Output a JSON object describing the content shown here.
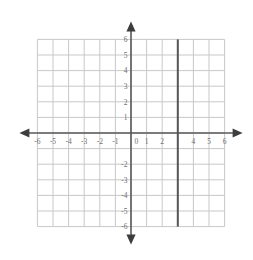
{
  "figure": {
    "kind": "cartesian-coordinate-plane",
    "background_color": "#ffffff",
    "grid_color": "#c8c8c8",
    "axis_color": "#58585a",
    "label_color": "#6e6e6e",
    "plot_line_color": "#55555a"
  },
  "chart_data": {
    "type": "line",
    "title": "",
    "subtitle": "",
    "xlabel": "",
    "ylabel": "",
    "xlim": [
      -6,
      6
    ],
    "ylim": [
      -6,
      6
    ],
    "grid": true,
    "legend": "none",
    "x_major_step": 1,
    "y_major_step": 1,
    "axis_arrows": [
      "left",
      "right",
      "up",
      "down"
    ],
    "x_tick_values": [
      -6,
      -5,
      -4,
      -3,
      -2,
      -1,
      0,
      1,
      2,
      4,
      5,
      6
    ],
    "x_tick_labels": [
      "-6",
      "-5",
      "-4",
      "-3",
      "-2",
      "-1",
      "0",
      "1",
      "2",
      "4",
      "5",
      "6"
    ],
    "x_tick_hidden_values": [
      3
    ],
    "y_tick_values": [
      6,
      5,
      4,
      3,
      2,
      1,
      -2,
      -3,
      -4,
      -5,
      -6
    ],
    "y_tick_labels": [
      "6",
      "5",
      "4",
      "3",
      "2",
      "1",
      "-2",
      "-3",
      "-4",
      "-5",
      "-6"
    ],
    "y_tick_hidden_values": [
      -1
    ],
    "origin_label": "0",
    "series": [
      {
        "name": "x = 3",
        "kind": "vertical-line",
        "equation": "x = 3",
        "x": 3,
        "y_from": -6,
        "y_to": 6,
        "color": "#55555a",
        "width_px": 2
      }
    ]
  },
  "labels": {
    "x_axis": [
      {
        "value": -6,
        "text": "-6"
      },
      {
        "value": -5,
        "text": "-5"
      },
      {
        "value": -4,
        "text": "-4"
      },
      {
        "value": -3,
        "text": "-3"
      },
      {
        "value": -2,
        "text": "-2"
      },
      {
        "value": -1,
        "text": "-1"
      },
      {
        "value": 0,
        "text": "0"
      },
      {
        "value": 1,
        "text": "1"
      },
      {
        "value": 2,
        "text": "2"
      },
      {
        "value": 4,
        "text": "4"
      },
      {
        "value": 5,
        "text": "5"
      },
      {
        "value": 6,
        "text": "6"
      }
    ],
    "y_axis": [
      {
        "value": 6,
        "text": "6"
      },
      {
        "value": 5,
        "text": "5"
      },
      {
        "value": 4,
        "text": "4"
      },
      {
        "value": 3,
        "text": "3"
      },
      {
        "value": 2,
        "text": "2"
      },
      {
        "value": 1,
        "text": "1"
      },
      {
        "value": -2,
        "text": "-2"
      },
      {
        "value": -3,
        "text": "-3"
      },
      {
        "value": -4,
        "text": "-4"
      },
      {
        "value": -5,
        "text": "-5"
      },
      {
        "value": -6,
        "text": "-6"
      }
    ]
  }
}
